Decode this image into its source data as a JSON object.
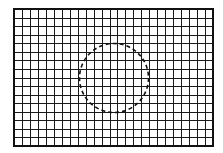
{
  "diagram": {
    "canvas": {
      "width": 223,
      "height": 153,
      "background": "#ffffff"
    },
    "grid": {
      "x": 14,
      "y": 9,
      "width": 199,
      "height": 137,
      "columns": 25,
      "rows": 16,
      "line_color": "#1a1a1a",
      "line_width": 1,
      "border_color": "#111111",
      "border_width": 2
    },
    "circle": {
      "cx": 114,
      "cy": 78,
      "r": 34.5,
      "stroke_color": "#111111",
      "stroke_width": 1.6,
      "dash": "4 3",
      "style": "dashed"
    }
  }
}
